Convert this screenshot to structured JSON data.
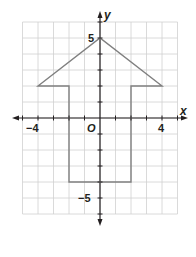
{
  "chart_data": {
    "type": "coordinate-plane",
    "title": "",
    "xlabel": "x",
    "ylabel": "y",
    "origin_label": "O",
    "xlim": [
      -5,
      5
    ],
    "ylim": [
      -6,
      6
    ],
    "grid": true,
    "x_tick_labels": [
      {
        "value": -4,
        "label": "−4"
      },
      {
        "value": 4,
        "label": "4"
      }
    ],
    "y_tick_labels": [
      {
        "value": 5,
        "label": "5"
      },
      {
        "value": -5,
        "label": "−5"
      }
    ],
    "shape": {
      "type": "polygon",
      "description": "upward arrow",
      "vertices": [
        [
          -4,
          2
        ],
        [
          0,
          5
        ],
        [
          4,
          2
        ],
        [
          2,
          2
        ],
        [
          2,
          -4
        ],
        [
          -2,
          -4
        ],
        [
          -2,
          2
        ]
      ]
    }
  },
  "colors": {
    "grid": "#d0d0d0",
    "axis": "#231f20",
    "shape": "#808080",
    "background": "#ffffff"
  }
}
